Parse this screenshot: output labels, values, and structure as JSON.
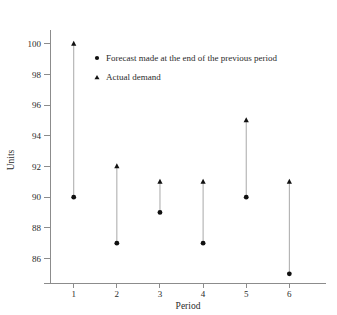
{
  "chart_data": {
    "type": "scatter",
    "title": "",
    "xlabel": "Period",
    "ylabel": "Units",
    "categories": [
      "1",
      "2",
      "3",
      "4",
      "5",
      "6"
    ],
    "x": [
      1,
      2,
      3,
      4,
      5,
      6
    ],
    "xlim": [
      0.45,
      6.85
    ],
    "ylim": [
      84.4,
      100.9
    ],
    "yticks": [
      86,
      88,
      90,
      92,
      94,
      96,
      98,
      100
    ],
    "ytick_labels": [
      "86",
      "88",
      "90",
      "92",
      "94",
      "96",
      "98",
      "100"
    ],
    "xtick_labels": [
      "1",
      "2",
      "3",
      "4",
      "5",
      "6"
    ],
    "grid": false,
    "legend_position": "upper-center",
    "series": [
      {
        "name": "Forecast made at the end of the previous period",
        "marker": "circle",
        "color": "#111111",
        "values": [
          90,
          87,
          89,
          87,
          90,
          85
        ]
      },
      {
        "name": "Actual demand",
        "marker": "triangle",
        "color": "#111111",
        "values": [
          100,
          92,
          91,
          91,
          95,
          91
        ]
      }
    ],
    "connectors": {
      "color": "#a8a8a8",
      "pairs": [
        {
          "period": 1,
          "low": 90,
          "high": 100
        },
        {
          "period": 2,
          "low": 87,
          "high": 92
        },
        {
          "period": 3,
          "low": 89,
          "high": 91
        },
        {
          "period": 4,
          "low": 87,
          "high": 91
        },
        {
          "period": 5,
          "low": 90,
          "high": 95
        },
        {
          "period": 6,
          "low": 85,
          "high": 91
        }
      ]
    }
  },
  "legend": {
    "items": [
      {
        "marker": "circle-marker",
        "label": "Forecast made at the end of the previous period"
      },
      {
        "marker": "triangle-marker",
        "label": "Actual demand"
      }
    ]
  },
  "axes": {
    "x_title": "Period",
    "y_title": "Units",
    "axis_color": "#8c8c8c"
  }
}
